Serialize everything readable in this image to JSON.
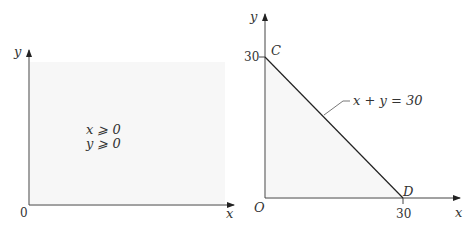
{
  "left_panel": {
    "axis_x_label": "x",
    "axis_y_label": "y",
    "origin_label": "0",
    "constraints": [
      "x ⩾ 0",
      "y ⩾ 0"
    ],
    "region_fill": "#f6f6f6"
  },
  "right_panel": {
    "axis_x_label": "x",
    "axis_y_label": "y",
    "origin_label": "O",
    "y_tick_label": "30",
    "x_tick_label": "30",
    "point_c_label": "C",
    "point_d_label": "D",
    "line_label": "x + y = 30",
    "region_fill": "#f6f6f6"
  },
  "colors": {
    "axis": "#444444",
    "text": "#333333",
    "boundary_line": "#222222"
  }
}
